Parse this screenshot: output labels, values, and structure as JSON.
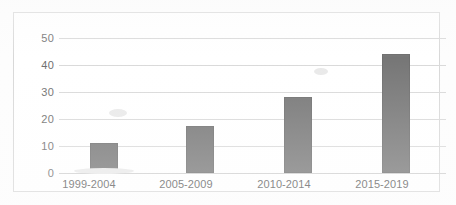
{
  "chart_data": {
    "type": "bar",
    "title": "",
    "subtitle": "",
    "xlabel": "",
    "ylabel": "",
    "categories": [
      "1999-2004",
      "2005-2009",
      "2010-2014",
      "2015-2019"
    ],
    "values": [
      11,
      17.5,
      28,
      44
    ],
    "series": [
      {
        "name": "",
        "values": [
          11,
          17.5,
          28,
          44
        ]
      }
    ],
    "ylim": [
      0,
      50
    ],
    "yticks": [
      0,
      10,
      20,
      30,
      40,
      50
    ],
    "ytick_labels": [
      "0",
      "10",
      "20",
      "30",
      "40",
      "50"
    ],
    "grid": true,
    "grid_axis": "y",
    "legend": false,
    "legend_position": "none",
    "annotations": [],
    "bar_color": "#767676",
    "gridline_color": "#d9d9d9",
    "frame_color": "#d8d8d8",
    "tick_label_color": "#6d6d6d",
    "category_label_color": "#595959",
    "background_color": "#ffffff"
  }
}
